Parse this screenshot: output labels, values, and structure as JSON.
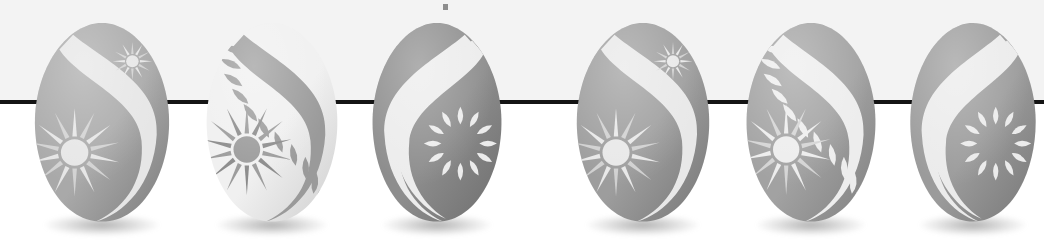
{
  "scene": {
    "title": "Decorated Easter eggs row",
    "width": 1044,
    "height": 251,
    "background_top": "#f3f3f3",
    "background_bottom": "#ffffff",
    "rule_color": "#141414",
    "rule_y": 100,
    "rule_thickness": 4,
    "speck": {
      "x": 443,
      "y": 4,
      "color": "#6b6b6b"
    },
    "egg_count": 6,
    "caption": ""
  },
  "eggs": [
    {
      "index": 1,
      "name": "egg-swirl-star-medium-gray",
      "pattern": "s-curve-stripe-right + large-starburst + small-starburst",
      "orientation": "right",
      "scheme": "dark-body-light-ornament",
      "body_light": "#a9a9a9",
      "body_dark": "#7d7d7d",
      "ornament": "#e6e6e6",
      "ornament_dark": "#d2d2d2",
      "x": 26,
      "y": 20,
      "w": 152,
      "h": 206
    },
    {
      "index": 2,
      "name": "egg-vine-star-white",
      "pattern": "s-curve-stripe-right + leaf-vine + large-starburst",
      "orientation": "right",
      "scheme": "light-body-dark-ornament",
      "body_light": "#f0f0f0",
      "body_dark": "#cfcfcf",
      "ornament": "#9a9a9a",
      "ornament_dark": "#8a8a8a",
      "x": 198,
      "y": 20,
      "w": 148,
      "h": 206
    },
    {
      "index": 3,
      "name": "egg-double-swirl-petal-ring-dark",
      "pattern": "double-s-curve-stripe-left + petal-ring",
      "orientation": "left",
      "scheme": "dark-body-light-ornament",
      "body_light": "#8d8d8d",
      "body_dark": "#6e6e6e",
      "ornament": "#ececec",
      "ornament_dark": "#cdcdcd",
      "x": 364,
      "y": 20,
      "w": 146,
      "h": 206
    },
    {
      "index": 4,
      "name": "egg-swirl-star-medium-gray-2",
      "pattern": "s-curve-stripe-right + large-starburst + small-starburst",
      "orientation": "right",
      "scheme": "dark-body-light-ornament",
      "body_light": "#9d9d9d",
      "body_dark": "#777777",
      "ornament": "#e8e8e8",
      "ornament_dark": "#d0d0d0",
      "x": 568,
      "y": 20,
      "w": 150,
      "h": 206
    },
    {
      "index": 5,
      "name": "egg-vine-star-medium-gray",
      "pattern": "s-curve-stripe-right + leaf-vine + large-starburst",
      "orientation": "right",
      "scheme": "dark-body-light-ornament",
      "body_light": "#a2a2a2",
      "body_dark": "#808080",
      "ornament": "#ededed",
      "ornament_dark": "#d4d4d4",
      "x": 738,
      "y": 20,
      "w": 146,
      "h": 206
    },
    {
      "index": 6,
      "name": "egg-double-swirl-petal-ring-gray",
      "pattern": "double-s-curve-stripe-left + petal-ring",
      "orientation": "left",
      "scheme": "dark-body-light-ornament",
      "body_light": "#9b9b9b",
      "body_dark": "#787878",
      "ornament": "#ebebeb",
      "ornament_dark": "#cfcfcf",
      "x": 902,
      "y": 20,
      "w": 142,
      "h": 206
    }
  ]
}
